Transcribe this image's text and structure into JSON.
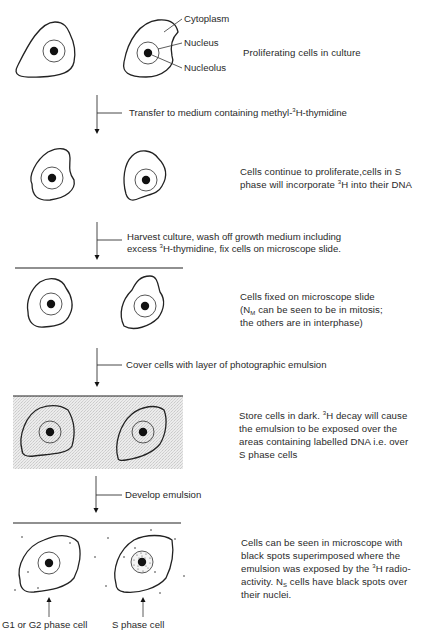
{
  "diagram": {
    "type": "flow-diagram",
    "cell_labels": {
      "cytoplasm": "Cytoplasm",
      "nucleus": "Nucleus",
      "nucleolus": "Nucleolus"
    },
    "stages": [
      {
        "id": "stage-1",
        "description": "Proliferating cells in culture"
      },
      {
        "id": "stage-2",
        "description_pre": "Cells continue to proliferate,cells in S phase will incorporate ",
        "isotope_sup": "3",
        "description_post": "H into their DNA"
      },
      {
        "id": "stage-3",
        "line1": "Cells fixed on microscope slide",
        "line2_pre": "(N",
        "line2_sub": "M",
        "line2_post": " can be seen to be in mitosis;",
        "line3": "the others are in interphase)"
      },
      {
        "id": "stage-4",
        "pre": "Store cells in dark. ",
        "sup": "3",
        "post": "H decay will cause the emulsion to be exposed over the areas containing labelled DNA i.e. over S phase cells"
      },
      {
        "id": "stage-5",
        "pre": "Cells can be seen in microscope with black spots superimposed where the emulsion was exposed by the ",
        "sup": "3",
        "mid": "H radio-activity. N",
        "sub": "S",
        "post": " cells have black spots over their nuclei."
      }
    ],
    "steps": [
      {
        "pre": "Transfer to medium containing methyl-",
        "sup": "3",
        "post": "H-thymidine"
      },
      {
        "line1": "Harvest culture, wash off growth medium including",
        "line2_pre": "excess ",
        "line2_sup": "3",
        "line2_post": "H-thymidine, fix cells on microscope slide."
      },
      {
        "label": "Cover cells with layer of photographic emulsion"
      },
      {
        "label": "Develop emulsion"
      }
    ],
    "bottom_labels": {
      "left": "G1 or G2 phase cell",
      "right": "S phase cell"
    }
  }
}
